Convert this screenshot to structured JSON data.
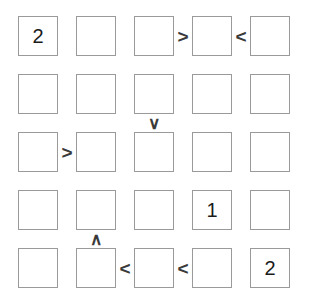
{
  "puzzle": {
    "type": "futoshiki",
    "rows": 5,
    "cols": 5,
    "cell_size_px": 40,
    "col_pitch_px": 58,
    "row_pitch_px": 58,
    "origin_x_px": 18,
    "origin_y_px": 16,
    "colors": {
      "background": "#ffffff",
      "cell_border": "#9a9a9a",
      "digit": "#1b1b1b",
      "constraint": "#3a3a3a"
    },
    "cells": [
      [
        {
          "id": "r1c1",
          "value": "2"
        },
        {
          "id": "r1c2",
          "value": ""
        },
        {
          "id": "r1c3",
          "value": ""
        },
        {
          "id": "r1c4",
          "value": ""
        },
        {
          "id": "r1c5",
          "value": ""
        }
      ],
      [
        {
          "id": "r2c1",
          "value": ""
        },
        {
          "id": "r2c2",
          "value": ""
        },
        {
          "id": "r2c3",
          "value": ""
        },
        {
          "id": "r2c4",
          "value": ""
        },
        {
          "id": "r2c5",
          "value": ""
        }
      ],
      [
        {
          "id": "r3c1",
          "value": ""
        },
        {
          "id": "r3c2",
          "value": ""
        },
        {
          "id": "r3c3",
          "value": ""
        },
        {
          "id": "r3c4",
          "value": ""
        },
        {
          "id": "r3c5",
          "value": ""
        }
      ],
      [
        {
          "id": "r4c1",
          "value": ""
        },
        {
          "id": "r4c2",
          "value": ""
        },
        {
          "id": "r4c3",
          "value": ""
        },
        {
          "id": "r4c4",
          "value": "1"
        },
        {
          "id": "r4c5",
          "value": ""
        }
      ],
      [
        {
          "id": "r5c1",
          "value": ""
        },
        {
          "id": "r5c2",
          "value": ""
        },
        {
          "id": "r5c3",
          "value": ""
        },
        {
          "id": "r5c4",
          "value": ""
        },
        {
          "id": "r5c5",
          "value": "2"
        }
      ]
    ],
    "constraints": [
      {
        "id": "h-r1-c3c4",
        "orientation": "horizontal",
        "row": 1,
        "left_col": 3,
        "symbol": ">"
      },
      {
        "id": "h-r1-c4c5",
        "orientation": "horizontal",
        "row": 1,
        "left_col": 4,
        "symbol": "<"
      },
      {
        "id": "h-r3-c1c2",
        "orientation": "horizontal",
        "row": 3,
        "left_col": 1,
        "symbol": ">"
      },
      {
        "id": "h-r5-c2c3",
        "orientation": "horizontal",
        "row": 5,
        "left_col": 2,
        "symbol": "<"
      },
      {
        "id": "h-r5-c3c4",
        "orientation": "horizontal",
        "row": 5,
        "left_col": 3,
        "symbol": "<"
      },
      {
        "id": "v-r2r3-c3",
        "orientation": "vertical",
        "col": 3,
        "top_row": 2,
        "symbol": "∨"
      },
      {
        "id": "v-r4r5-c2",
        "orientation": "vertical",
        "col": 2,
        "top_row": 4,
        "symbol": "∧"
      }
    ]
  }
}
